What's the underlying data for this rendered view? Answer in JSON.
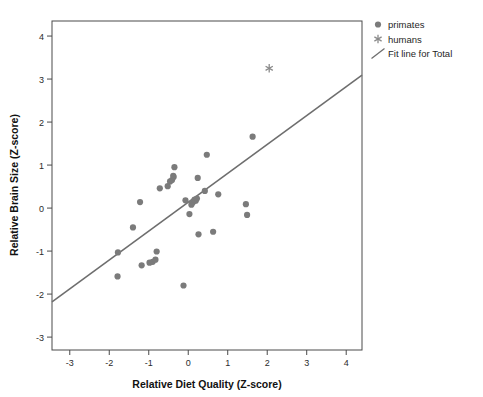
{
  "chart_data": {
    "type": "scatter",
    "title": "",
    "xlabel": "Relative Diet Quality (Z-score)",
    "ylabel": "Relative Brain Size (Z-score)",
    "xlim": [
      -3.45,
      4.4
    ],
    "ylim": [
      -3.3,
      4.35
    ],
    "xticks": [
      -3,
      -2,
      -1,
      0,
      1,
      2,
      3,
      4
    ],
    "xtick_labels": [
      "-3",
      "-2",
      "-1",
      "0",
      "1",
      "2",
      "3",
      "4"
    ],
    "yticks": [
      -3,
      -2,
      -1,
      0,
      1,
      2,
      3,
      4
    ],
    "ytick_labels": [
      "-3",
      "-2",
      "-1",
      "0",
      "1",
      "2",
      "3",
      "4"
    ],
    "grid": false,
    "legend_position": "top-right outside",
    "marker_color": "#7b7b7b",
    "line_color": "#6e6e6e",
    "frame_color": "#4a4a4a",
    "series": [
      {
        "name": "primates",
        "marker": "circle",
        "color": "#7b7b7b",
        "points": [
          [
            -1.79,
            -1.59
          ],
          [
            -1.78,
            -1.03
          ],
          [
            -1.4,
            -0.45
          ],
          [
            -1.22,
            0.14
          ],
          [
            -1.18,
            -1.33
          ],
          [
            -0.98,
            -1.27
          ],
          [
            -0.9,
            -1.25
          ],
          [
            -0.83,
            -1.2
          ],
          [
            -0.8,
            -1.01
          ],
          [
            -0.72,
            0.46
          ],
          [
            -0.52,
            0.51
          ],
          [
            -0.46,
            0.62
          ],
          [
            -0.41,
            0.65
          ],
          [
            -0.38,
            0.75
          ],
          [
            -0.37,
            0.72
          ],
          [
            -0.35,
            0.95
          ],
          [
            -0.12,
            -1.8
          ],
          [
            -0.07,
            0.18
          ],
          [
            0.03,
            -0.14
          ],
          [
            0.08,
            0.08
          ],
          [
            0.1,
            0.12
          ],
          [
            0.13,
            0.15
          ],
          [
            0.16,
            0.2
          ],
          [
            0.19,
            0.17
          ],
          [
            0.22,
            0.22
          ],
          [
            0.24,
            0.7
          ],
          [
            0.26,
            -0.61
          ],
          [
            0.42,
            0.4
          ],
          [
            0.47,
            1.24
          ],
          [
            0.63,
            -0.55
          ],
          [
            0.76,
            0.32
          ],
          [
            1.46,
            0.09
          ],
          [
            1.49,
            -0.16
          ],
          [
            1.63,
            1.66
          ]
        ]
      },
      {
        "name": "humans",
        "marker": "asterisk",
        "color": "#8a8a8a",
        "points": [
          [
            2.05,
            3.25
          ]
        ]
      }
    ],
    "fit_line": {
      "name": "Fit line for Total",
      "color": "#6e6e6e",
      "x_start": -3.45,
      "y_start": -2.18,
      "x_end": 4.4,
      "y_end": 3.09,
      "slope": 0.671,
      "intercept": 0.13
    }
  },
  "legend": {
    "items": [
      {
        "label": "primates",
        "marker": "circle"
      },
      {
        "label": "humans",
        "marker": "asterisk"
      },
      {
        "label": "Fit line for Total",
        "marker": "line"
      }
    ]
  },
  "axes": {
    "x_title": "Relative Diet Quality (Z-score)",
    "y_title": "Relative Brain Size (Z-score)"
  }
}
